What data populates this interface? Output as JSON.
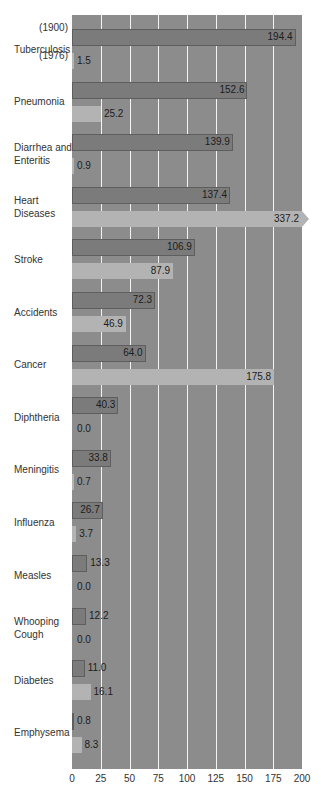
{
  "chart_data": {
    "type": "bar",
    "orientation": "horizontal",
    "title": "",
    "xlabel": "",
    "ylabel": "",
    "xlim": [
      0,
      200
    ],
    "xticks": [
      0,
      25,
      50,
      75,
      100,
      125,
      150,
      175,
      200
    ],
    "grid": true,
    "legend": {
      "entries": [
        "(1900)",
        "(1976)"
      ],
      "position": "inline-first-category"
    },
    "categories": [
      "Tuberculosis",
      "Pneumonia",
      "Diarrhea and Enteritis",
      "Heart Diseases",
      "Stroke",
      "Accidents",
      "Cancer",
      "Diphtheria",
      "Meningitis",
      "Influenza",
      "Measles",
      "Whooping Cough",
      "Diabetes",
      "Emphysema"
    ],
    "category_lines": [
      [
        "Tuberculosis"
      ],
      [
        "Pneumonia"
      ],
      [
        "Diarrhea and",
        "Enteritis"
      ],
      [
        "Heart",
        "Diseases"
      ],
      [
        "Stroke"
      ],
      [
        "Accidents"
      ],
      [
        "Cancer"
      ],
      [
        "Diphtheria"
      ],
      [
        "Meningitis"
      ],
      [
        "Influenza"
      ],
      [
        "Measles"
      ],
      [
        "Whooping",
        "Cough"
      ],
      [
        "Diabetes"
      ],
      [
        "Emphysema"
      ]
    ],
    "series": [
      {
        "name": "1900",
        "values": [
          194.4,
          152.6,
          139.9,
          137.4,
          106.9,
          72.3,
          64.0,
          40.3,
          33.8,
          26.7,
          13.3,
          12.2,
          11.0,
          0.8
        ],
        "labels": [
          "194.4",
          "152.6",
          "139.9",
          "137.4",
          "106.9",
          "72.3",
          "64.0",
          "40.3",
          "33.8",
          "26.7",
          "13.3",
          "12.2",
          "11.0",
          "0.8"
        ]
      },
      {
        "name": "1976",
        "values": [
          1.5,
          25.2,
          0.9,
          337.2,
          87.9,
          46.9,
          175.8,
          0.0,
          0.7,
          3.7,
          0.0,
          0.0,
          16.1,
          8.3
        ],
        "labels": [
          "1.5",
          "25.2",
          "0.9",
          "337.2",
          "87.9",
          "46.9",
          "175.8",
          "0.0",
          "0.7",
          "3.7",
          "0.0",
          "0.0",
          "16.1",
          "8.3"
        ]
      }
    ],
    "annotations": [
      "Heart Diseases 1976 bar (337.2) exceeds axis, drawn with arrowhead"
    ],
    "colors": {
      "plot_bg": "#8c8c8c",
      "bar_1900": "#7b7b7b",
      "bar_1976": "#b3b3b3",
      "grid": "#f4f4f4"
    }
  },
  "legend_labels": {
    "y1900": "(1900)",
    "y1976": "(1976)"
  }
}
